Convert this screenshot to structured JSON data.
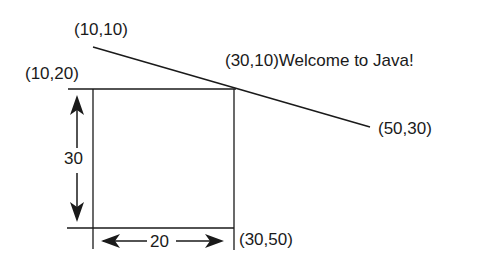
{
  "labels": {
    "line_start": "(10,10)",
    "line_end_text": "(30,10)Welcome to Java!",
    "line_end": "(50,30)",
    "rect_top_left": "(10,20)",
    "rect_bottom_right": "(30,50)",
    "height_dim": "30",
    "width_dim": "20"
  },
  "colors": {
    "stroke": "#1a1a1a",
    "background": "#ffffff"
  }
}
